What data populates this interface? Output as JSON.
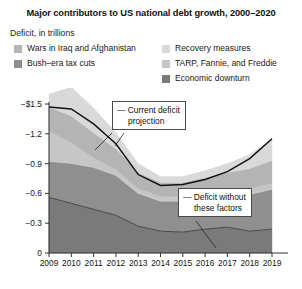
{
  "title": "Major contributors to US national debt growth, 2000–2020",
  "axis_caption": "Deficit, in trillions",
  "legend": {
    "left_column": [
      {
        "label": "Wars in Iraq and Afghanistan",
        "color": "#b4b4b4",
        "key": "wars"
      },
      {
        "label": "Bush–era tax cuts",
        "color": "#8f8f8f",
        "key": "bush_tax_cuts"
      }
    ],
    "right_column": [
      {
        "label": "Recovery measures",
        "color": "#d9d9d9",
        "key": "recovery"
      },
      {
        "label": "TARP, Fannie, and Freddie",
        "color": "#c6c6c6",
        "key": "tarp"
      },
      {
        "label": "Economic downturn",
        "color": "#7a7a7a",
        "key": "downturn"
      }
    ]
  },
  "annotations": [
    {
      "id": "current-deficit-projection",
      "text_line1": "Current deficit",
      "text_line2": "projection",
      "dash": "—"
    },
    {
      "id": "deficit-without-these-factors",
      "text_line1": "Deficit without",
      "text_line2": "these factors",
      "dash": "—"
    }
  ],
  "chart_data": {
    "type": "area",
    "stacked": true,
    "title": "Major contributors to US national debt growth, 2000–2020",
    "subtitle": "Deficit, in trillions",
    "xlabel": "",
    "ylabel": "Deficit, in trillions",
    "grid": false,
    "legend_position": "top",
    "categories": [
      2009,
      2010,
      2011,
      2012,
      2013,
      2014,
      2015,
      2016,
      2017,
      2018,
      2019
    ],
    "xtick_labels": [
      "2009",
      "2010",
      "2011",
      "2012",
      "2013",
      "2014",
      "2015",
      "2016",
      "2017",
      "2018",
      "2019"
    ],
    "ytick_labels": [
      "−$1.5",
      "−1.2",
      "−0.9",
      "−0.6",
      "−0.3",
      "0"
    ],
    "ytick_values": [
      -1.5,
      -1.2,
      -0.9,
      -0.6,
      -0.3,
      0
    ],
    "ylim": [
      -1.5,
      0
    ],
    "y_sign": "negative",
    "note": "Values are magnitudes of deficit in trillions of dollars, plotted downward from 0.",
    "series": [
      {
        "name": "Economic downturn",
        "color": "#7a7a7a",
        "values": [
          0.56,
          0.5,
          0.44,
          0.38,
          0.27,
          0.22,
          0.21,
          0.24,
          0.26,
          0.22,
          0.24
        ]
      },
      {
        "name": "Bush–era tax cuts",
        "color": "#8f8f8f",
        "values": [
          0.36,
          0.4,
          0.42,
          0.4,
          0.33,
          0.3,
          0.31,
          0.32,
          0.33,
          0.37,
          0.4
        ]
      },
      {
        "name": "TARP, Fannie, and Freddie",
        "color": "#c6c6c6",
        "values": [
          0.31,
          0.21,
          0.1,
          0.06,
          0.05,
          0.05,
          0.05,
          0.05,
          0.05,
          0.06,
          0.06
        ]
      },
      {
        "name": "Wars in Iraq and Afghanistan",
        "color": "#b4b4b4",
        "values": [
          0.24,
          0.27,
          0.25,
          0.21,
          0.16,
          0.14,
          0.14,
          0.15,
          0.17,
          0.2,
          0.23
        ]
      },
      {
        "name": "Recovery measures",
        "color": "#d9d9d9",
        "values": [
          0.13,
          0.29,
          0.25,
          0.16,
          0.09,
          0.06,
          0.06,
          0.07,
          0.09,
          0.14,
          0.22
        ]
      }
    ],
    "totals": [
      1.47,
      1.45,
      1.3,
      1.1,
      0.79,
      0.68,
      0.69,
      0.74,
      0.82,
      0.95,
      1.15
    ],
    "deficit_without_factors": [
      0.56,
      0.5,
      0.44,
      0.38,
      0.27,
      0.22,
      0.21,
      0.24,
      0.26,
      0.22,
      0.24
    ]
  }
}
